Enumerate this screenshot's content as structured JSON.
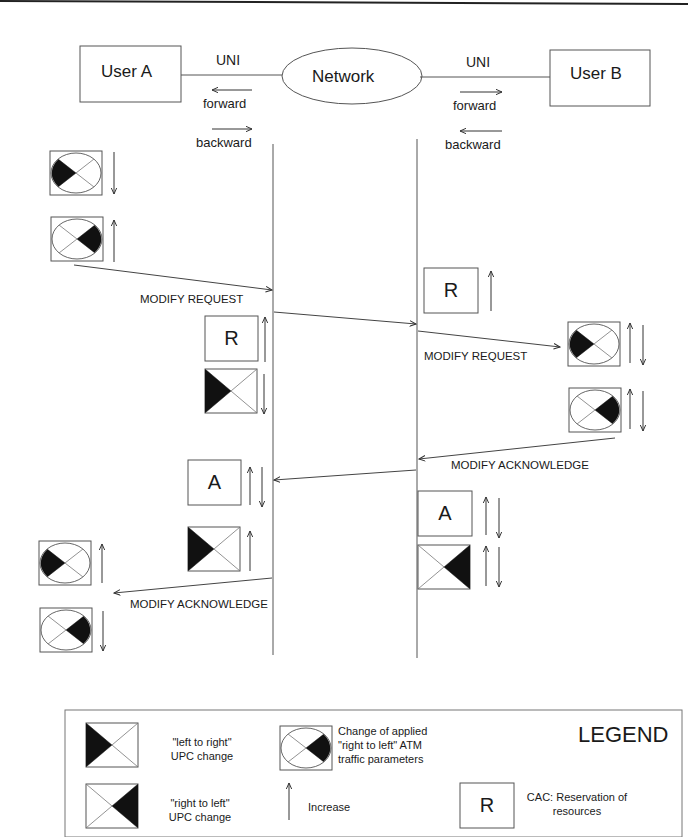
{
  "diagram": {
    "entities": {
      "user_a": "User A",
      "network": "Network",
      "user_b": "User B"
    },
    "interfaces": {
      "left_uni": "UNI",
      "right_uni": "UNI"
    },
    "directions": {
      "left_forward": "forward",
      "left_backward": "backward",
      "right_forward": "forward",
      "right_backward": "backward"
    },
    "messages": [
      {
        "label": "MODIFY REQUEST",
        "from": "User A",
        "to": "Network"
      },
      {
        "label": "MODIFY REQUEST",
        "from": "Network",
        "to": "User B"
      },
      {
        "label": "MODIFY ACKNOWLEDGE",
        "from": "User B",
        "to": "Network"
      },
      {
        "label": "MODIFY ACKNOWLEDGE",
        "from": "Network",
        "to": "User A"
      }
    ],
    "boxes": {
      "reservation_letter": "R",
      "acknowledge_letter": "A"
    },
    "colors": {
      "line": "#555555",
      "fill": "#111111",
      "background": "#ffffff"
    }
  },
  "legend": {
    "title": "LEGEND",
    "items": [
      {
        "symbol": "left-to-right-upc",
        "text_line1": "\"left to right\"",
        "text_line2": "UPC change"
      },
      {
        "symbol": "right-to-left-upc",
        "text_line1": "\"right to left\"",
        "text_line2": "UPC change"
      },
      {
        "symbol": "atm-params",
        "text_line1": "Change of applied",
        "text_line2": "\"right to left\" ATM",
        "text_line3": "traffic parameters"
      },
      {
        "symbol": "increase-arrow",
        "text_line1": "Increase"
      },
      {
        "symbol": "R",
        "text_line1": "CAC: Reservation of",
        "text_line2": "resources"
      }
    ]
  }
}
